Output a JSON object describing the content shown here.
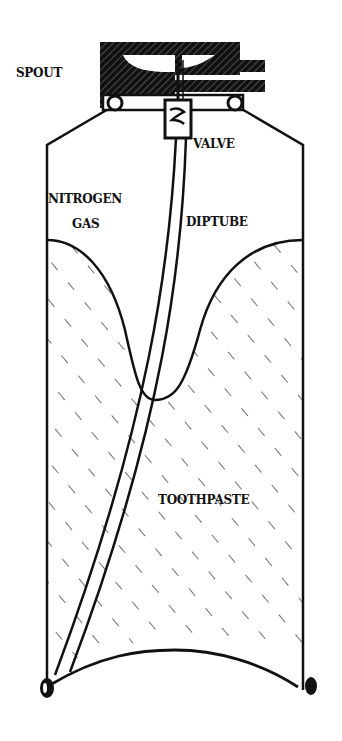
{
  "diagram": {
    "type": "cross-section",
    "labels": {
      "spout": "SPOUT",
      "valve": "VALVE",
      "nitrogen_gas_line1": "NITROGEN",
      "nitrogen_gas_line2": "GAS",
      "diptube": "DIPTUBE",
      "toothpaste": "TOOTHPASTE"
    },
    "colors": {
      "ink": "#111111",
      "paper": "#ffffff"
    }
  }
}
